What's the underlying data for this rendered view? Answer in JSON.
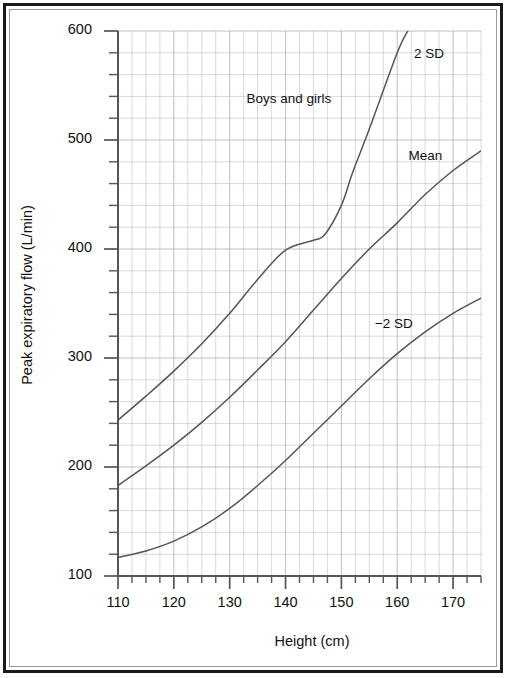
{
  "figure": {
    "background": "#ffffff",
    "frame_color": "#1a1a1a",
    "grid_color": "#b9b9b9",
    "axis_color": "#555555",
    "curve_color": "#555555"
  },
  "chart_data": {
    "type": "line",
    "title": "",
    "xlabel": "Height (cm)",
    "ylabel": "Peak expiratory flow (L/min)",
    "xlim": [
      108,
      176
    ],
    "ylim": [
      100,
      600
    ],
    "xticks": [
      110,
      120,
      130,
      140,
      150,
      160,
      170
    ],
    "yticks": [
      100,
      200,
      300,
      400,
      500,
      600
    ],
    "minor_x_step": 2.5,
    "minor_y_step": 20,
    "grid": true,
    "legend_position": "inline-annotations",
    "annotations": [
      {
        "text": "2 SD",
        "x": 163,
        "y": 578
      },
      {
        "text": "Boys and girls",
        "x": 133,
        "y": 537
      },
      {
        "text": "Mean",
        "x": 162,
        "y": 484
      },
      {
        "text": "−2 SD",
        "x": 156,
        "y": 330
      }
    ],
    "series": [
      {
        "name": "2 SD",
        "x": [
          110,
          115,
          120,
          125,
          130,
          135,
          140,
          145,
          147,
          150,
          152,
          155,
          160,
          162
        ],
        "y": [
          243,
          265,
          288,
          313,
          341,
          372,
          399,
          408,
          413,
          440,
          470,
          510,
          580,
          601
        ]
      },
      {
        "name": "Mean",
        "x": [
          110,
          115,
          120,
          125,
          130,
          135,
          140,
          145,
          150,
          155,
          160,
          165,
          170,
          175
        ],
        "y": [
          183,
          201,
          220,
          241,
          264,
          289,
          315,
          344,
          373,
          400,
          424,
          450,
          472,
          490
        ]
      },
      {
        "name": "-2 SD",
        "x": [
          110,
          115,
          120,
          125,
          130,
          135,
          140,
          145,
          150,
          155,
          160,
          165,
          170,
          175
        ],
        "y": [
          117,
          123,
          132,
          145,
          162,
          183,
          206,
          231,
          256,
          281,
          304,
          324,
          341,
          355
        ]
      }
    ]
  },
  "axis": {
    "y_tick_labels": [
      "600",
      "500",
      "400",
      "300",
      "200",
      "100"
    ],
    "x_tick_labels": [
      "110",
      "120",
      "130",
      "140",
      "150",
      "160",
      "170"
    ]
  }
}
